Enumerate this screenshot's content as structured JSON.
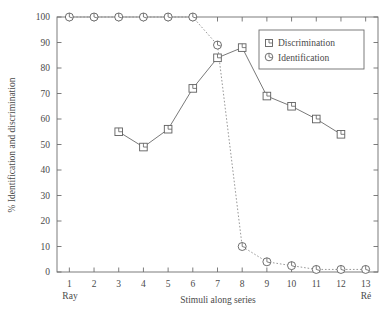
{
  "chart_data": {
    "type": "line",
    "title": "",
    "xlabel": "Stimuli along series",
    "ylabel": "% Identification and discrimination",
    "x": [
      1,
      2,
      3,
      4,
      5,
      6,
      7,
      8,
      9,
      10,
      11,
      12,
      13
    ],
    "xlim": [
      0.5,
      13.5
    ],
    "ylim": [
      0,
      100
    ],
    "xticks": [
      "1",
      "2",
      "3",
      "4",
      "5",
      "6",
      "7",
      "8",
      "9",
      "10",
      "11",
      "12",
      "13"
    ],
    "yticks": [
      "0",
      "10",
      "20",
      "30",
      "40",
      "50",
      "60",
      "70",
      "80",
      "90",
      "100"
    ],
    "grid": false,
    "legend_position": "top-right",
    "x_endpoint_labels": {
      "left": "Ray",
      "right": "Ré"
    },
    "series": [
      {
        "name": "Discrimination",
        "marker": "square",
        "linestyle": "solid",
        "x": [
          3,
          4,
          5,
          6,
          7,
          8,
          9,
          10,
          11,
          12,
          13
        ],
        "values": [
          55,
          49,
          56,
          72,
          84,
          88,
          69,
          65,
          60,
          54,
          null
        ]
      },
      {
        "name": "Identification",
        "marker": "circle",
        "linestyle": "dotted",
        "x": [
          1,
          2,
          3,
          4,
          5,
          6,
          7,
          8,
          9,
          10,
          11,
          12,
          13
        ],
        "values": [
          100,
          100,
          100,
          100,
          100,
          100,
          89,
          10,
          4,
          2.5,
          1,
          1,
          1
        ]
      }
    ]
  },
  "legend": {
    "entries": [
      {
        "label": "Discrimination",
        "marker": "square-marker-icon"
      },
      {
        "label": "Identification",
        "marker": "circle-marker-icon"
      }
    ]
  }
}
